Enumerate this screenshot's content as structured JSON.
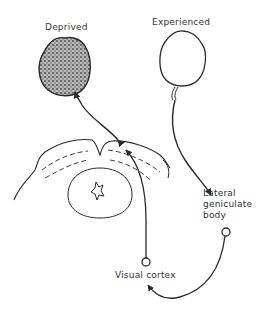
{
  "labels": {
    "deprived": "Deprived",
    "experienced": "Experienced",
    "lgn_line1": "Lateral",
    "lgn_line2": "geniculate",
    "lgn_line3": "body",
    "visual_cortex": "Visual cortex"
  },
  "colors": {
    "ink": "#2a2a2a",
    "stipple": "#555555",
    "background": "#ffffff"
  }
}
